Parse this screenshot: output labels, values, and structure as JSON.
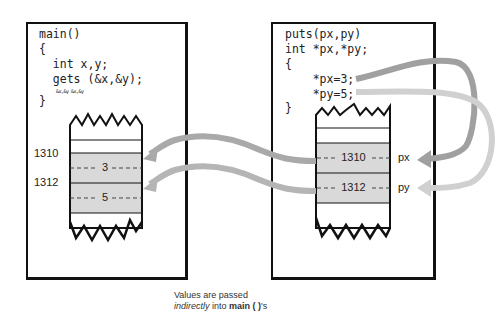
{
  "left_frame": {
    "title": "main()",
    "code_lines": [
      "main()",
      "{",
      "  int x,y;",
      "  gets (&x,&y);",
      "",
      "}"
    ],
    "scribble": "&x,&y  &x,&y",
    "stack": {
      "cells": [
        {
          "address": "1310",
          "value": "3"
        },
        {
          "address": "1312",
          "value": "5"
        }
      ]
    }
  },
  "right_frame": {
    "title": "puts(px,py)",
    "code_lines": [
      "puts(px,py)",
      "int *px,*py;",
      "{",
      "    *px=3;",
      "    *py=5;",
      "}"
    ],
    "stack": {
      "cells": [
        {
          "value": "1310",
          "pointer": "px"
        },
        {
          "value": "1312",
          "pointer": "py"
        }
      ]
    }
  },
  "caption": {
    "line1": "Values are passed",
    "line2_italic": "indirectly",
    "line2_mid": " into ",
    "line2_bold": "main ( )",
    "line2_end": "'s"
  },
  "colors": {
    "cell_fill": "#d9d9d9",
    "arrow_dark": "#a9a9a9",
    "arrow_light": "#d0d0d0",
    "line": "#111111"
  }
}
